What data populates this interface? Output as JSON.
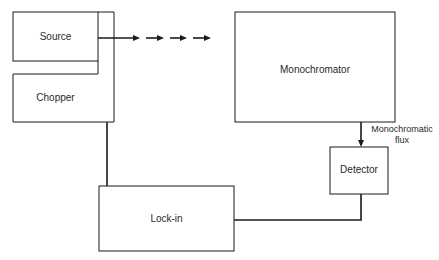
{
  "diagram": {
    "blocks": {
      "source": "Source",
      "chopper": "Chopper",
      "monochromator": "Monochromator",
      "detector": "Detector",
      "lockin": "Lock-in"
    },
    "annotations": {
      "flux_line1": "Monochromatic",
      "flux_line2": "flux"
    },
    "colors": {
      "line": "#1a1a1a",
      "text": "#2a2a2a",
      "background": "#ffffff"
    }
  }
}
